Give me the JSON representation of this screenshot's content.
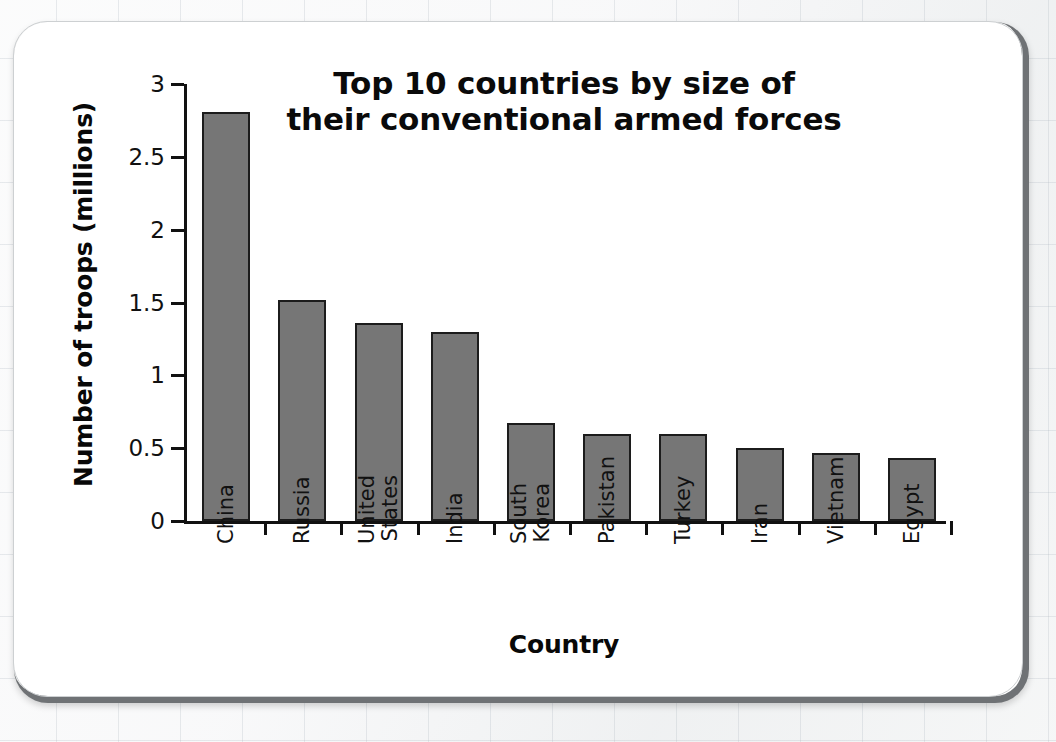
{
  "background": {
    "surface": "graph-paper",
    "paper_color": "#f2f3f4",
    "card_color": "#ffffff",
    "card_border_color": "#6f7275"
  },
  "chart_data": {
    "type": "bar",
    "title_lines": [
      "Top 10 countries by size of",
      "their conventional armed forces"
    ],
    "xlabel": "Country",
    "ylabel": "Number of troops (millions)",
    "categories": [
      "China",
      "Russia",
      "United States",
      "India",
      "South Korea",
      "Pakistan",
      "Turkey",
      "Iran",
      "Vietnam",
      "Egypt"
    ],
    "category_label_lines": [
      [
        "China"
      ],
      [
        "Russia"
      ],
      [
        "United",
        "States"
      ],
      [
        "India"
      ],
      [
        "South",
        "Korea"
      ],
      [
        "Pakistan"
      ],
      [
        "Turkey"
      ],
      [
        "Iran"
      ],
      [
        "Vietnam"
      ],
      [
        "Egypt"
      ]
    ],
    "values": [
      2.81,
      1.52,
      1.36,
      1.3,
      0.67,
      0.6,
      0.6,
      0.5,
      0.47,
      0.43
    ],
    "ylim": [
      0,
      3
    ],
    "ytick_values": [
      0,
      0.5,
      1,
      1.5,
      2,
      2.5,
      3
    ],
    "ytick_labels": [
      "0",
      "0.5",
      "1",
      "1.5",
      "2",
      "2.5",
      "3"
    ],
    "grid": false,
    "legend": false,
    "bar_color": "#767676",
    "bar_edge_color": "#1c1c1c",
    "axis_color": "#111111"
  }
}
